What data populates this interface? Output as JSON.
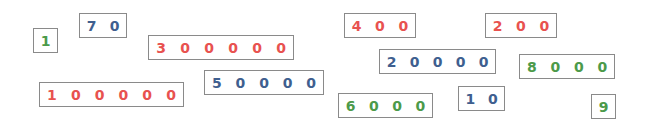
{
  "colors": {
    "red": "#e8524f",
    "blue": "#3f5f8f",
    "green": "#4c9a4a",
    "border": "#8a8a8a"
  },
  "tiles": [
    {
      "value": "1",
      "color": "green",
      "x": 33,
      "y": 28,
      "w": 25
    },
    {
      "value": "70",
      "color": "blue",
      "x": 79,
      "y": 13,
      "w": 48
    },
    {
      "value": "300000",
      "color": "red",
      "x": 148,
      "y": 35,
      "w": 146
    },
    {
      "value": "100000",
      "color": "red",
      "x": 39,
      "y": 82,
      "w": 145
    },
    {
      "value": "50000",
      "color": "blue",
      "x": 204,
      "y": 70,
      "w": 120
    },
    {
      "value": "400",
      "color": "red",
      "x": 344,
      "y": 13,
      "w": 72
    },
    {
      "value": "200",
      "color": "red",
      "x": 485,
      "y": 13,
      "w": 72
    },
    {
      "value": "20000",
      "color": "blue",
      "x": 379,
      "y": 49,
      "w": 117
    },
    {
      "value": "8000",
      "color": "green",
      "x": 519,
      "y": 54,
      "w": 96
    },
    {
      "value": "6000",
      "color": "green",
      "x": 338,
      "y": 93,
      "w": 95
    },
    {
      "value": "10",
      "color": "blue",
      "x": 458,
      "y": 86,
      "w": 47
    },
    {
      "value": "9",
      "color": "green",
      "x": 591,
      "y": 94,
      "w": 25
    }
  ]
}
